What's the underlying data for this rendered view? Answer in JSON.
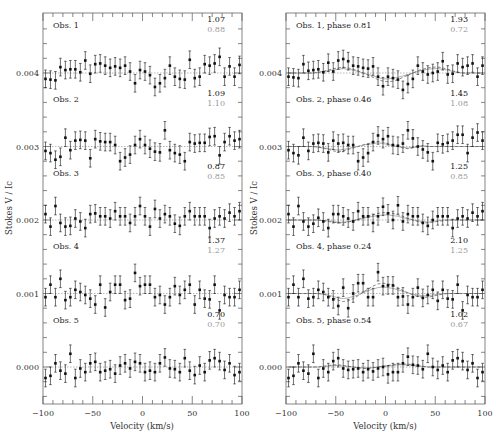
{
  "chart_data": [
    {
      "type": "scatter",
      "panel": "left",
      "xlabel": "Velocity (km/s)",
      "ylabel": "Stokes V / Ic",
      "xlim": [
        -100,
        100
      ],
      "ylim": [
        -0.0005,
        0.0048
      ],
      "xticks": [
        -100,
        -50,
        0,
        50,
        100
      ],
      "xtick_labels": [
        "−100",
        "−50",
        "0",
        "50",
        "100"
      ],
      "yticks": [
        0.0,
        0.001,
        0.002,
        0.003,
        0.004
      ],
      "ytick_labels": [
        "0.000",
        "0.001",
        "0.002",
        "0.003",
        "0.004"
      ],
      "grid": false,
      "legend": null,
      "x": [
        -97.5,
        -92.5,
        -87.5,
        -82.5,
        -77.5,
        -72.5,
        -67.5,
        -62.5,
        -57.5,
        -52.5,
        -47.5,
        -42.5,
        -37.5,
        -32.5,
        -27.5,
        -22.5,
        -17.5,
        -12.5,
        -7.5,
        -2.5,
        2.5,
        7.5,
        12.5,
        17.5,
        22.5,
        27.5,
        32.5,
        37.5,
        42.5,
        47.5,
        52.5,
        57.5,
        62.5,
        67.5,
        72.5,
        77.5,
        82.5,
        87.5,
        92.5,
        97.5
      ],
      "series": [
        {
          "name": "Obs. 1",
          "offset": 0.004,
          "label_black": "1.07",
          "label_grey": "0.88",
          "values_1e5": [
            -8,
            -9,
            -10,
            8,
            4,
            5,
            5,
            1,
            17,
            -1,
            12,
            13,
            10,
            7,
            9,
            7,
            10,
            2,
            -14,
            4,
            2,
            -3,
            -19,
            -14,
            -7,
            10,
            -5,
            -8,
            -9,
            18,
            -7,
            -5,
            12,
            10,
            13,
            22,
            -5,
            9,
            -5,
            11
          ],
          "err_1e5": 12
        },
        {
          "name": "Obs. 2",
          "offset": 0.003,
          "label_black": "1.09",
          "label_grey": "1.10",
          "values_1e5": [
            -6,
            -9,
            -18,
            -14,
            12,
            -5,
            8,
            9,
            8,
            -16,
            10,
            7,
            6,
            6,
            2,
            -20,
            -15,
            -11,
            2,
            10,
            2,
            -3,
            -7,
            -8,
            22,
            -5,
            -9,
            -11,
            -20,
            6,
            4,
            5,
            5,
            13,
            14,
            -12,
            6,
            14,
            8,
            10
          ],
          "err_1e5": 12
        },
        {
          "name": "Obs. 3",
          "offset": 0.002,
          "label_black": "0.87",
          "label_grey": "0.85",
          "values_1e5": [
            8,
            -9,
            19,
            -4,
            -9,
            -8,
            2,
            -2,
            -11,
            8,
            9,
            5,
            5,
            2,
            12,
            5,
            5,
            -4,
            5,
            19,
            5,
            -9,
            15,
            2,
            8,
            5,
            -5,
            -8,
            5,
            12,
            5,
            5,
            5,
            -11,
            2,
            5,
            2,
            10,
            5,
            12
          ],
          "err_1e5": 12
        },
        {
          "name": "Obs. 4",
          "offset": 0.001,
          "label_black": "1.37",
          "label_grey": "1.27",
          "values_1e5": [
            -5,
            12,
            -5,
            20,
            -9,
            -5,
            5,
            2,
            -2,
            -7,
            -15,
            12,
            -19,
            2,
            12,
            12,
            -9,
            -7,
            28,
            10,
            12,
            12,
            -5,
            -2,
            -15,
            -5,
            10,
            -2,
            5,
            12,
            -15,
            5,
            -7,
            -8,
            12,
            -23,
            -2,
            -5,
            -5,
            5
          ],
          "err_1e5": 12
        },
        {
          "name": "Obs. 5",
          "offset": 0.0,
          "label_black": "0.70",
          "label_grey": "0.70",
          "values_1e5": [
            -15,
            -12,
            5,
            -5,
            -9,
            18,
            -15,
            -2,
            -7,
            5,
            7,
            -7,
            -5,
            -3,
            -9,
            2,
            5,
            -2,
            7,
            5,
            -7,
            -5,
            -7,
            5,
            13,
            -2,
            -3,
            -7,
            12,
            -5,
            -11,
            2,
            -7,
            9,
            12,
            8,
            -4,
            5,
            -11,
            -7
          ],
          "err_1e5": 12
        }
      ],
      "model_curves": {
        "black": "near-flat dotted line at each baseline",
        "grey": "near-flat line at each baseline"
      }
    },
    {
      "type": "scatter",
      "panel": "right",
      "xlabel": "Velocity (km/s)",
      "ylabel": "Stokes V / Ic",
      "xlim": [
        -100,
        100
      ],
      "ylim": [
        -0.0005,
        0.0048
      ],
      "xticks": [
        -100,
        -50,
        0,
        50,
        100
      ],
      "xtick_labels": [
        "−100",
        "−50",
        "0",
        "50",
        "100"
      ],
      "yticks": [
        0.0,
        0.001,
        0.002,
        0.003,
        0.004
      ],
      "ytick_labels": [
        "0.000",
        "0.001",
        "0.002",
        "0.003",
        "0.004"
      ],
      "grid": false,
      "legend": null,
      "x": [
        -97.5,
        -92.5,
        -87.5,
        -82.5,
        -77.5,
        -72.5,
        -67.5,
        -62.5,
        -57.5,
        -52.5,
        -47.5,
        -42.5,
        -37.5,
        -32.5,
        -27.5,
        -22.5,
        -17.5,
        -12.5,
        -7.5,
        -2.5,
        2.5,
        7.5,
        12.5,
        17.5,
        22.5,
        27.5,
        32.5,
        37.5,
        42.5,
        47.5,
        52.5,
        57.5,
        62.5,
        67.5,
        72.5,
        77.5,
        82.5,
        87.5,
        92.5,
        97.5
      ],
      "series": [
        {
          "name": "Obs. 1, phase 0.81",
          "offset": 0.004,
          "label_black": "1.93",
          "label_grey": "0.72",
          "values_1e5": [
            -5,
            -6,
            -7,
            12,
            3,
            4,
            5,
            1,
            14,
            2,
            17,
            19,
            16,
            10,
            9,
            7,
            6,
            9,
            -5,
            -18,
            -5,
            -7,
            -9,
            -23,
            -15,
            -8,
            10,
            2,
            -2,
            0,
            2,
            16,
            -2,
            -1,
            13,
            8,
            10,
            13,
            -5,
            10
          ],
          "err_1e5": 12,
          "model_black_1e5": [
            0,
            0,
            0,
            0,
            0,
            0,
            1,
            2,
            4,
            6,
            7,
            8,
            7,
            5,
            3,
            0,
            -3,
            -6,
            -9,
            -11,
            -12,
            -11,
            -9,
            -6,
            -3,
            0,
            3,
            5,
            7,
            8,
            8,
            7,
            5,
            3,
            1,
            0,
            0,
            0,
            0,
            0
          ],
          "model_grey_1e5": [
            0,
            0,
            0,
            0,
            0,
            0,
            1,
            2,
            3,
            4,
            5,
            6,
            5,
            4,
            2,
            0,
            -2,
            -4,
            -6,
            -8,
            -8,
            -7,
            -6,
            -4,
            -2,
            0,
            2,
            4,
            5,
            6,
            6,
            5,
            4,
            2,
            1,
            0,
            0,
            0,
            0,
            0
          ]
        },
        {
          "name": "Obs. 2, phase 0.46",
          "offset": 0.003,
          "label_black": "1.45",
          "label_grey": "1.08",
          "values_1e5": [
            -5,
            -9,
            -12,
            12,
            -6,
            4,
            5,
            4,
            -8,
            8,
            4,
            5,
            2,
            2,
            -20,
            -15,
            -9,
            6,
            15,
            10,
            14,
            2,
            1,
            4,
            22,
            11,
            0,
            -4,
            -8,
            -20,
            5,
            3,
            5,
            8,
            16,
            16,
            -9,
            12,
            19,
            8
          ],
          "err_1e5": 12,
          "model_black_1e5": [
            0,
            0,
            0,
            0,
            0,
            0,
            -1,
            -2,
            -4,
            -6,
            -7,
            -6,
            -4,
            -2,
            0,
            2,
            4,
            6,
            7,
            6,
            4,
            2,
            0,
            -2,
            -3,
            -2,
            0,
            1,
            0,
            0,
            0,
            0,
            0,
            0,
            0,
            0,
            0,
            0,
            0,
            0
          ],
          "model_grey_1e5": [
            0,
            0,
            0,
            0,
            0,
            0,
            -1,
            -2,
            -3,
            -4,
            -5,
            -4,
            -3,
            -1,
            0,
            2,
            3,
            4,
            5,
            4,
            3,
            1,
            0,
            -1,
            -2,
            -1,
            0,
            1,
            0,
            0,
            0,
            0,
            0,
            0,
            0,
            0,
            0,
            0,
            0,
            0
          ]
        },
        {
          "name": "Obs. 3, phase 0.40",
          "offset": 0.002,
          "label_black": "1.25",
          "label_grey": "0.85",
          "values_1e5": [
            8,
            -9,
            19,
            -2,
            -9,
            -5,
            3,
            -2,
            -11,
            8,
            8,
            5,
            2,
            -2,
            12,
            5,
            5,
            -4,
            5,
            18,
            9,
            0,
            20,
            -2,
            8,
            5,
            5,
            -4,
            -8,
            0,
            5,
            5,
            5,
            -11,
            2,
            5,
            2,
            10,
            5,
            12
          ],
          "err_1e5": 12,
          "model_black_1e5": [
            0,
            0,
            0,
            0,
            0,
            0,
            0,
            -1,
            -2,
            -3,
            -4,
            -4,
            -3,
            -1,
            1,
            3,
            5,
            7,
            9,
            10,
            10,
            9,
            7,
            5,
            2,
            0,
            -2,
            -4,
            -4,
            -3,
            -2,
            -1,
            0,
            0,
            0,
            0,
            0,
            0,
            0,
            0
          ],
          "model_grey_1e5": [
            0,
            0,
            0,
            0,
            0,
            0,
            0,
            -1,
            -1,
            -2,
            -3,
            -3,
            -2,
            -1,
            1,
            2,
            4,
            5,
            6,
            7,
            7,
            6,
            5,
            3,
            2,
            0,
            -1,
            -2,
            -3,
            -2,
            -1,
            0,
            0,
            0,
            0,
            0,
            0,
            0,
            0,
            0
          ]
        },
        {
          "name": "Obs. 4, phase 0.24",
          "offset": 0.001,
          "label_black": "2.10",
          "label_grey": "1.25",
          "values_1e5": [
            -5,
            12,
            -5,
            20,
            -7,
            -5,
            5,
            2,
            -5,
            -8,
            -17,
            8,
            -20,
            0,
            14,
            14,
            -5,
            -5,
            29,
            10,
            11,
            11,
            -5,
            -4,
            -15,
            -5,
            8,
            -6,
            -2,
            5,
            -10,
            5,
            -7,
            -8,
            12,
            -23,
            -2,
            -5,
            -5,
            5
          ],
          "err_1e5": 12,
          "model_black_1e5": [
            0,
            0,
            0,
            0,
            0,
            0,
            0,
            -1,
            -3,
            -6,
            -9,
            -11,
            -10,
            -7,
            -3,
            2,
            6,
            10,
            13,
            14,
            13,
            11,
            8,
            4,
            1,
            -2,
            -4,
            -5,
            -5,
            -4,
            -2,
            -1,
            0,
            0,
            0,
            0,
            0,
            0,
            0,
            0
          ],
          "model_grey_1e5": [
            0,
            0,
            0,
            0,
            0,
            0,
            0,
            -1,
            -2,
            -4,
            -6,
            -7,
            -6,
            -4,
            -2,
            1,
            4,
            6,
            8,
            9,
            8,
            7,
            5,
            3,
            1,
            -1,
            -2,
            -3,
            -3,
            -2,
            -1,
            0,
            0,
            0,
            0,
            0,
            0,
            0,
            0,
            0
          ]
        },
        {
          "name": "Obs. 5, phase 0.54",
          "offset": 0.0,
          "label_black": "1.02",
          "label_grey": "0.67",
          "values_1e5": [
            -15,
            -12,
            5,
            -5,
            -9,
            18,
            -15,
            -2,
            -7,
            8,
            12,
            -2,
            -4,
            -3,
            -2,
            -7,
            -3,
            -6,
            -2,
            0,
            -10,
            -7,
            -7,
            5,
            14,
            3,
            2,
            -3,
            18,
            0,
            -4,
            2,
            -7,
            9,
            12,
            8,
            -4,
            5,
            -15,
            -7
          ],
          "err_1e5": 12,
          "model_black_1e5": [
            0,
            0,
            0,
            0,
            0,
            0,
            0,
            1,
            2,
            3,
            3,
            2,
            1,
            0,
            -1,
            -2,
            -2,
            -1,
            0,
            1,
            2,
            3,
            4,
            4,
            4,
            3,
            2,
            1,
            0,
            0,
            0,
            0,
            0,
            0,
            0,
            0,
            0,
            0,
            0,
            0
          ],
          "model_grey_1e5": [
            0,
            0,
            0,
            0,
            0,
            0,
            0,
            1,
            1,
            2,
            2,
            1,
            1,
            0,
            -1,
            -1,
            -1,
            -1,
            0,
            1,
            1,
            2,
            3,
            3,
            3,
            2,
            1,
            1,
            0,
            0,
            0,
            0,
            0,
            0,
            0,
            0,
            0,
            0,
            0,
            0
          ]
        }
      ]
    }
  ],
  "panels": {
    "left": {
      "x_axis_label": "Velocity (km/s)",
      "y_axis_label": "Stokes V / Ic",
      "obs_labels": [
        "Obs. 1",
        "Obs. 2",
        "Obs. 3",
        "Obs. 4",
        "Obs. 5"
      ],
      "values_black": [
        "1.07",
        "1.09",
        "0.87",
        "1.37",
        "0.70"
      ],
      "values_grey": [
        "0.88",
        "1.10",
        "0.85",
        "1.27",
        "0.70"
      ]
    },
    "right": {
      "x_axis_label": "Velocity (km/s)",
      "y_axis_label": "Stokes V / Ic",
      "obs_labels": [
        "Obs. 1, phase 0.81",
        "Obs. 2, phase 0.46",
        "Obs. 3, phase 0.40",
        "Obs. 4, phase 0.24",
        "Obs. 5, phase 0.54"
      ],
      "values_black": [
        "1.93",
        "1.45",
        "1.25",
        "2.10",
        "1.02"
      ],
      "values_grey": [
        "0.72",
        "1.08",
        "0.85",
        "1.25",
        "0.67"
      ]
    }
  },
  "colors": {
    "data": "#111111",
    "axis": "#555555",
    "model_black": "#555555",
    "model_grey": "#a0a0a0",
    "label_grey": "#9a9a9a"
  }
}
